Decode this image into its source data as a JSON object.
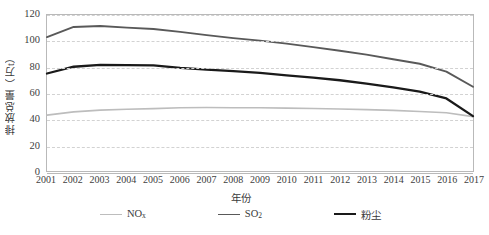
{
  "chart_data": {
    "type": "line",
    "title": "",
    "xlabel": "年份",
    "ylabel": "排放总量（万t）",
    "xlim": [
      2001,
      2017
    ],
    "ylim": [
      0,
      120
    ],
    "ytick_step": 20,
    "grid": true,
    "legend_position": "bottom",
    "categories": [
      "2001",
      "2002",
      "2003",
      "2004",
      "2005",
      "2006",
      "2007",
      "2008",
      "2009",
      "2010",
      "2011",
      "2012",
      "2013",
      "2014",
      "2015",
      "2016",
      "2017"
    ],
    "series": [
      {
        "name": "NOx",
        "label": "NO",
        "sublabel": "x",
        "color": "#bdbdbd",
        "width": 1.6,
        "values": [
          43.0,
          45.5,
          46.8,
          47.5,
          48.0,
          48.6,
          48.8,
          48.7,
          48.6,
          48.4,
          48.1,
          47.7,
          47.2,
          46.6,
          45.8,
          44.8,
          41.8
        ]
      },
      {
        "name": "SO2",
        "label": "SO",
        "sublabel": "2",
        "color": "#595959",
        "width": 1.9,
        "values": [
          103.0,
          110.8,
          111.5,
          110.3,
          109.2,
          107.0,
          104.5,
          102.2,
          100.3,
          98.0,
          95.3,
          92.5,
          89.5,
          86.0,
          82.5,
          76.5,
          64.8
        ]
      },
      {
        "name": "粉尘",
        "label": "粉尘",
        "sublabel": "",
        "color": "#1a1a1a",
        "width": 2.3,
        "values": [
          75.0,
          80.2,
          81.6,
          81.4,
          81.2,
          79.3,
          78.0,
          76.8,
          75.4,
          73.6,
          71.8,
          69.8,
          67.2,
          64.3,
          61.0,
          55.8,
          42.2
        ]
      }
    ],
    "yticks": [
      "0",
      "20",
      "40",
      "60",
      "80",
      "100",
      "120"
    ]
  },
  "colors": {
    "grid": "#d2d2d2",
    "frame": "#b9b9b9",
    "text": "#3a3a3a",
    "background": "#ffffff"
  }
}
